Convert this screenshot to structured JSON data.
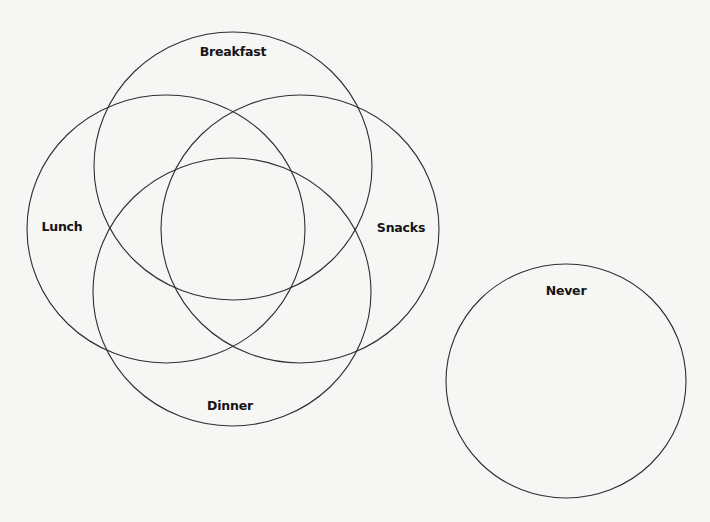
{
  "diagram": {
    "type": "venn",
    "stroke_color": "#2f2f2f",
    "background_color": "#f6f6f5",
    "sets": [
      {
        "id": "breakfast",
        "label": "Breakfast",
        "cx": 233,
        "cy": 166,
        "rx": 139,
        "ry": 134,
        "label_x": 233,
        "label_y": 56
      },
      {
        "id": "lunch",
        "label": "Lunch",
        "cx": 166,
        "cy": 229,
        "rx": 139,
        "ry": 134,
        "label_x": 62,
        "label_y": 231
      },
      {
        "id": "snacks",
        "label": "Snacks",
        "cx": 300,
        "cy": 229,
        "rx": 139,
        "ry": 134,
        "label_x": 401,
        "label_y": 232
      },
      {
        "id": "dinner",
        "label": "Dinner",
        "cx": 232,
        "cy": 292,
        "rx": 139,
        "ry": 134,
        "label_x": 230,
        "label_y": 410
      },
      {
        "id": "never",
        "label": "Never",
        "cx": 566,
        "cy": 381,
        "rx": 120,
        "ry": 117,
        "label_x": 566,
        "label_y": 295
      }
    ]
  },
  "labels": {
    "breakfast": "Breakfast",
    "lunch": "Lunch",
    "snacks": "Snacks",
    "dinner": "Dinner",
    "never": "Never"
  }
}
